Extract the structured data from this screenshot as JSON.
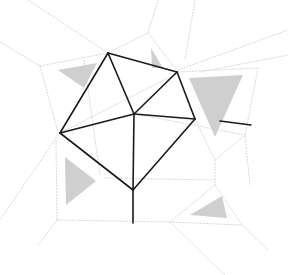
{
  "diagram": {
    "type": "geometric-line-drawing",
    "colors": {
      "background": "#ffffff",
      "dark_line": "#1a1a1a",
      "light_line": "#d9d9d9",
      "shade": "#cfcfcf"
    },
    "dark_vertices": {
      "top": [
        108,
        53
      ],
      "upper_right": [
        177,
        72
      ],
      "right": [
        195,
        119
      ],
      "center": [
        134,
        114
      ],
      "left": [
        60,
        133
      ],
      "bottom": [
        133,
        190
      ],
      "stem_end": [
        133,
        223
      ]
    },
    "dark_edges": [
      [
        [
          108,
          53
        ],
        [
          177,
          72
        ]
      ],
      [
        [
          177,
          72
        ],
        [
          195,
          119
        ]
      ],
      [
        [
          195,
          119
        ],
        [
          133,
          190
        ]
      ],
      [
        [
          133,
          190
        ],
        [
          60,
          133
        ]
      ],
      [
        [
          60,
          133
        ],
        [
          108,
          53
        ]
      ],
      [
        [
          108,
          53
        ],
        [
          134,
          114
        ]
      ],
      [
        [
          177,
          72
        ],
        [
          134,
          114
        ]
      ],
      [
        [
          195,
          119
        ],
        [
          134,
          114
        ]
      ],
      [
        [
          60,
          133
        ],
        [
          134,
          114
        ]
      ],
      [
        [
          133,
          190
        ],
        [
          134,
          114
        ]
      ],
      [
        [
          133,
          190
        ],
        [
          133,
          223
        ]
      ],
      [
        [
          220,
          121
        ],
        [
          251,
          125
        ]
      ]
    ],
    "shaded_triangles": [
      [
        [
          58,
          70
        ],
        [
          97,
          63
        ],
        [
          84,
          88
        ]
      ],
      [
        [
          151,
          48
        ],
        [
          163,
          68
        ],
        [
          152,
          68
        ]
      ],
      [
        [
          189,
          78
        ],
        [
          243,
          75
        ],
        [
          215,
          137
        ]
      ],
      [
        [
          65,
          157
        ],
        [
          66,
          205
        ],
        [
          96,
          181
        ]
      ],
      [
        [
          190,
          215
        ],
        [
          222,
          196
        ],
        [
          227,
          218
        ]
      ]
    ],
    "light_lines": [
      [
        [
          28,
          0
        ],
        [
          108,
          53
        ]
      ],
      [
        [
          0,
          42
        ],
        [
          40,
          66
        ]
      ],
      [
        [
          40,
          66
        ],
        [
          108,
          53
        ]
      ],
      [
        [
          40,
          66
        ],
        [
          58,
          132
        ]
      ],
      [
        [
          108,
          53
        ],
        [
          148,
          33
        ]
      ],
      [
        [
          148,
          33
        ],
        [
          158,
          0
        ]
      ],
      [
        [
          148,
          33
        ],
        [
          178,
          72
        ]
      ],
      [
        [
          195,
          0
        ],
        [
          185,
          60
        ]
      ],
      [
        [
          177,
          72
        ],
        [
          258,
          68
        ]
      ],
      [
        [
          178,
          70
        ],
        [
          288,
          30
        ]
      ],
      [
        [
          200,
          72
        ],
        [
          288,
          55
        ]
      ],
      [
        [
          258,
          68
        ],
        [
          245,
          135
        ]
      ],
      [
        [
          245,
          135
        ],
        [
          250,
          185
        ]
      ],
      [
        [
          195,
          119
        ],
        [
          215,
          160
        ]
      ],
      [
        [
          215,
          160
        ],
        [
          245,
          135
        ]
      ],
      [
        [
          215,
          160
        ],
        [
          215,
          185
        ]
      ],
      [
        [
          58,
          135
        ],
        [
          0,
          220
        ]
      ],
      [
        [
          56,
          140
        ],
        [
          57,
          220
        ]
      ],
      [
        [
          57,
          220
        ],
        [
          170,
          222
        ]
      ],
      [
        [
          57,
          220
        ],
        [
          38,
          245
        ]
      ],
      [
        [
          105,
          178
        ],
        [
          215,
          180
        ]
      ],
      [
        [
          170,
          222
        ],
        [
          215,
          185
        ]
      ],
      [
        [
          215,
          185
        ],
        [
          242,
          225
        ]
      ],
      [
        [
          170,
          222
        ],
        [
          242,
          225
        ]
      ],
      [
        [
          170,
          222
        ],
        [
          225,
          275
        ]
      ],
      [
        [
          242,
          225
        ],
        [
          268,
          250
        ]
      ],
      [
        [
          135,
          114
        ],
        [
          245,
          135
        ]
      ],
      [
        [
          84,
          60
        ],
        [
          100,
          175
        ]
      ],
      [
        [
          60,
          133
        ],
        [
          180,
          72
        ]
      ]
    ]
  }
}
